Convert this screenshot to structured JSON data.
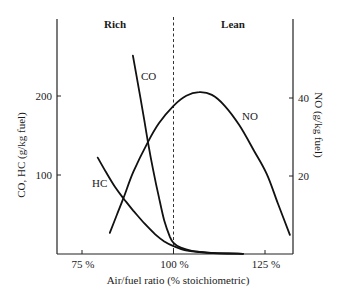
{
  "chart_data": {
    "type": "line",
    "title": "",
    "region_labels": {
      "rich": "Rich",
      "lean": "Lean"
    },
    "xlabel": "Air/fuel ratio (% stoichiometric)",
    "ylabel_left": "CO, HC (g/kg fuel)",
    "ylabel_right": "NO (g/kg fuel)",
    "xlim": [
      72,
      133
    ],
    "ylim_left": [
      0,
      300
    ],
    "ylim_right": [
      0,
      60
    ],
    "x_ticks": [
      {
        "value": 75,
        "label": "75%"
      },
      {
        "value": 100,
        "label": "100%"
      },
      {
        "value": 125,
        "label": "125%"
      }
    ],
    "y_ticks_left": [
      {
        "value": 100,
        "label": "100"
      },
      {
        "value": 200,
        "label": "200"
      }
    ],
    "y_ticks_right": [
      {
        "value": 20,
        "label": "20"
      },
      {
        "value": 40,
        "label": "40"
      }
    ],
    "stoichiometric_line": {
      "x": 100,
      "style": "dashed"
    },
    "grid": false,
    "series": [
      {
        "name": "CO",
        "label": "CO",
        "axis": "left",
        "points": [
          [
            88.9,
            251
          ],
          [
            90.5,
            210
          ],
          [
            92.0,
            170
          ],
          [
            93.0,
            142
          ],
          [
            94.5,
            105
          ],
          [
            96.0,
            72
          ],
          [
            97.5,
            42
          ],
          [
            99.0,
            22
          ],
          [
            100.0,
            14
          ],
          [
            102,
            8
          ],
          [
            105,
            4
          ],
          [
            110,
            1.5
          ],
          [
            115,
            0.6
          ],
          [
            119,
            0.3
          ]
        ]
      },
      {
        "name": "HC",
        "label": "HC",
        "axis": "left",
        "points": [
          [
            79.3,
            122
          ],
          [
            81.5,
            104
          ],
          [
            84.0,
            85
          ],
          [
            86.4,
            70
          ],
          [
            89.0,
            55
          ],
          [
            92.0,
            39
          ],
          [
            95.0,
            25
          ],
          [
            97.5,
            16
          ],
          [
            100.0,
            10
          ],
          [
            103,
            5
          ],
          [
            107,
            2.5
          ],
          [
            112,
            1
          ],
          [
            119,
            0.3
          ]
        ]
      },
      {
        "name": "NO",
        "label": "NO",
        "axis": "right",
        "points": [
          [
            82.6,
            5.4
          ],
          [
            84.5,
            10
          ],
          [
            86.4,
            14.5
          ],
          [
            89.0,
            21
          ],
          [
            93.0,
            28.7
          ],
          [
            96.0,
            33.5
          ],
          [
            100.0,
            38
          ],
          [
            103.5,
            40.6
          ],
          [
            107.0,
            41.5
          ],
          [
            110.5,
            40.8
          ],
          [
            114.0,
            38
          ],
          [
            118.0,
            33
          ],
          [
            122.0,
            26.5
          ],
          [
            125.5,
            20.5
          ],
          [
            128.5,
            13
          ],
          [
            131.8,
            4.9
          ]
        ]
      }
    ]
  }
}
